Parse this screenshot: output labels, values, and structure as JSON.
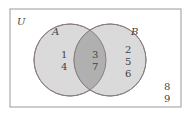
{
  "diagram": {
    "type": "venn",
    "universe_label": "U",
    "sets": [
      {
        "name": "A",
        "label": "A",
        "only": [
          "1",
          "4"
        ]
      },
      {
        "name": "B",
        "label": "B",
        "only": [
          "2",
          "5",
          "6"
        ]
      }
    ],
    "intersection": [
      "3",
      "7"
    ],
    "outside": [
      "8",
      "9"
    ],
    "colors": {
      "border": "#888888",
      "circle_fill": "#d9d9d9",
      "circle_stroke": "#8a7f7f",
      "intersection_fill": "#b3b3b3",
      "text": "#444444"
    }
  }
}
